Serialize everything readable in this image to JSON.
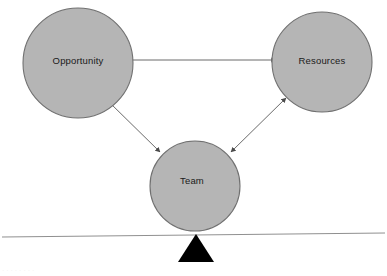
{
  "diagram": {
    "background_color": "#ffffff",
    "node_fill_color": "#b5b5b5",
    "node_stroke_color": "#6d6d6d",
    "arrow_color": "#5a5a5a",
    "baseline_color": "#8c8c8c",
    "fulcrum_color": "#000000",
    "label_color": "#1a1a1a",
    "nodes": [
      {
        "id": "opportunity",
        "label": "Opportunity",
        "cx": 78,
        "cy": 63,
        "r": 55
      },
      {
        "id": "resources",
        "label": "Resources",
        "cx": 322,
        "cy": 62,
        "r": 50
      },
      {
        "id": "team",
        "label": "Team",
        "cx": 195,
        "cy": 186,
        "r": 45
      }
    ],
    "connectors": [
      {
        "id": "opportunity-resources",
        "from": "opportunity",
        "to": "resources",
        "direction": "bidirectional"
      },
      {
        "id": "opportunity-team",
        "from": "opportunity",
        "to": "team",
        "direction": "bidirectional"
      },
      {
        "id": "resources-team",
        "from": "resources",
        "to": "team",
        "direction": "bidirectional"
      }
    ],
    "baseline": {
      "id": "balance-beam",
      "x1": 2,
      "y1": 237,
      "x2": 385,
      "y2": 233
    },
    "fulcrum": {
      "id": "fulcrum-triangle",
      "apex_x": 196,
      "apex_y": 235,
      "base_left_x": 178,
      "base_right_x": 214,
      "base_y": 262
    },
    "caption": "· · · · · · · ·"
  }
}
